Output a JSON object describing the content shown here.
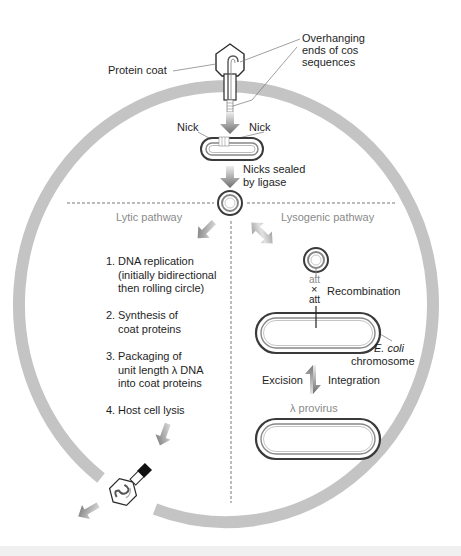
{
  "figure": {
    "colors": {
      "cell_wall": "#c4c4c4",
      "dna_outline": "#3a3a3a",
      "arrow_dark": "#777777",
      "arrow_light": "#dedede",
      "divider": "#555555",
      "pathway_label": "#8a8a8a",
      "text": "#1e1e1e"
    }
  },
  "labels": {
    "protein_coat": "Protein coat",
    "overhanging_line1": "Overhanging",
    "overhanging_line2": "ends of cos",
    "overhanging_line3": "sequences",
    "nick_left": "Nick",
    "nick_right": "Nick",
    "nicks_sealed_line1": "Nicks sealed",
    "nicks_sealed_line2": "by ligase",
    "lytic_pathway": "Lytic pathway",
    "lysogenic_pathway": "Lysogenic pathway",
    "att_top": "att",
    "att_cross": "×",
    "att_bottom": "att",
    "recombination": "Recombination",
    "ecoli_line1": "E. coli",
    "ecoli_line2": "chromosome",
    "excision": "Excision",
    "integration": "Integration",
    "provirus": "λ provirus"
  },
  "lytic_steps": [
    {
      "num": "1.",
      "lines": [
        "DNA replication",
        "(initially bidirectional",
        "then rolling circle)"
      ]
    },
    {
      "num": "2.",
      "lines": [
        "Synthesis of",
        "coat proteins"
      ]
    },
    {
      "num": "3.",
      "lines": [
        "Packaging of",
        "unit length λ DNA",
        "into coat proteins"
      ]
    },
    {
      "num": "4.",
      "lines": [
        "Host cell lysis"
      ]
    }
  ]
}
